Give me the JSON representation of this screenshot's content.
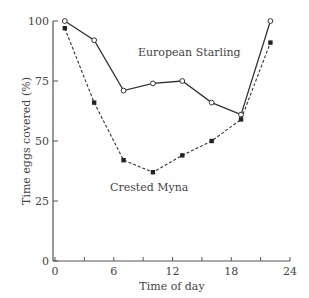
{
  "chart_data": {
    "type": "line",
    "title": "",
    "xlabel": "Time of day",
    "ylabel": "Time eggs covered (%)",
    "xlim": [
      0,
      24
    ],
    "ylim": [
      0,
      100
    ],
    "xticks": [
      0,
      6,
      12,
      18,
      24
    ],
    "xminor_ticks": [
      3,
      9,
      15,
      21
    ],
    "yticks": [
      0,
      25,
      50,
      75,
      100
    ],
    "grid": false,
    "legend": "inline labels",
    "series": [
      {
        "name": "European Starling",
        "marker": "open-circle",
        "line": "solid",
        "x": [
          1,
          4,
          7,
          10,
          13,
          16,
          19,
          22
        ],
        "values": [
          100,
          92,
          71,
          74,
          75,
          66,
          61,
          100
        ]
      },
      {
        "name": "Crested Myna",
        "marker": "filled-square",
        "line": "dashed",
        "x": [
          1,
          4,
          7,
          10,
          13,
          16,
          19,
          22
        ],
        "values": [
          97,
          66,
          42,
          37,
          44,
          50,
          59,
          91
        ]
      }
    ],
    "colors": {
      "line": "#333333",
      "axis": "#555555",
      "text": "#444444"
    }
  }
}
